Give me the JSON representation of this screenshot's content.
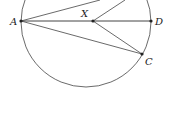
{
  "diagram": {
    "type": "geometry",
    "circle": {
      "cx": 86,
      "cy": 22,
      "r": 65
    },
    "points": {
      "A": {
        "x": 21,
        "y": 21,
        "label": "A"
      },
      "X": {
        "x": 93,
        "y": 21,
        "label": "X"
      },
      "D": {
        "x": 151,
        "y": 21,
        "label": "D"
      },
      "C": {
        "x": 142,
        "y": 54,
        "label": "C"
      }
    },
    "segments": [
      [
        "A",
        "D"
      ],
      [
        "A",
        "C"
      ],
      [
        "X",
        "C"
      ],
      [
        "A",
        "top-chord-end"
      ],
      [
        "X",
        "top-chord-end-2"
      ]
    ],
    "stroke_color": "#444444"
  },
  "caption": {
    "text": "...",
    "note": "text truncated at bottom edge"
  }
}
